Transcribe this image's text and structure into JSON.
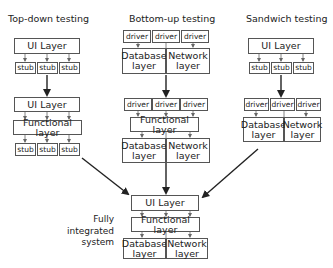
{
  "columns": {
    "top_down": {
      "title": "Top-down testing",
      "stage1": {
        "ui": "UI Layer",
        "stubs": [
          "stub",
          "stub",
          "stub"
        ]
      },
      "stage2": {
        "ui": "UI Layer",
        "functional": "Functional layer",
        "stubs": [
          "stub",
          "stub",
          "stub"
        ]
      }
    },
    "bottom_up": {
      "title": "Bottom-up testing",
      "stage1": {
        "drivers": [
          "driver",
          "driver",
          "driver"
        ],
        "database": "Database layer",
        "network": "Network layer"
      },
      "stage2": {
        "drivers": [
          "driver",
          "driver",
          "driver"
        ],
        "functional": "Functional layer",
        "database": "Database layer",
        "network": "Network layer"
      }
    },
    "sandwich": {
      "title": "Sandwich testing",
      "stage1": {
        "ui": "UI Layer",
        "stubs": [
          "stub",
          "stub",
          "stub"
        ]
      },
      "stage2": {
        "drivers": [
          "driver",
          "driver",
          "driver"
        ],
        "database": "Database layer",
        "network": "Network layer"
      }
    }
  },
  "final": {
    "caption": "Fully integrated system",
    "ui": "UI Layer",
    "functional": "Functional layer",
    "database": "Database layer",
    "network": "Network layer"
  }
}
